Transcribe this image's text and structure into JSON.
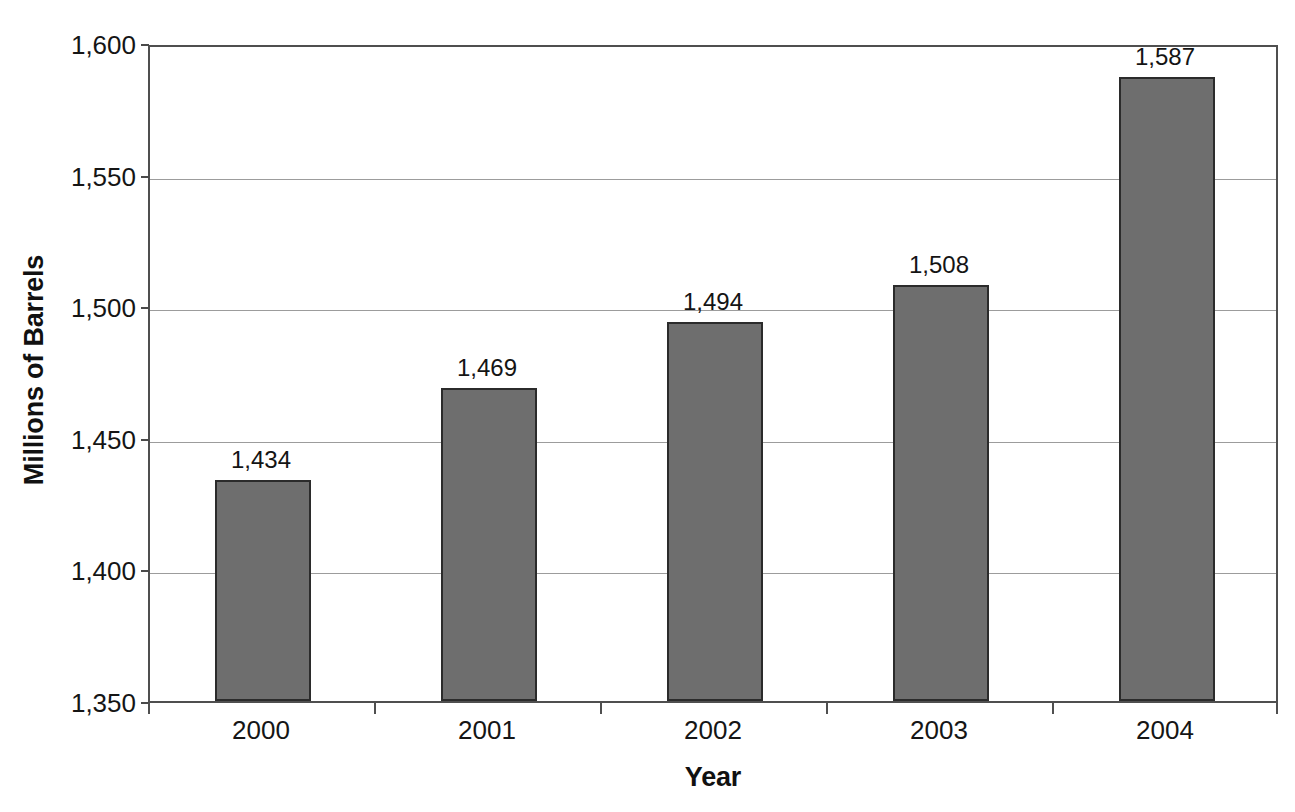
{
  "chart_data": {
    "type": "bar",
    "title": "",
    "subtitle": "",
    "xlabel": "Year",
    "ylabel": "Millions of Barrels",
    "categories": [
      "2000",
      "2001",
      "2002",
      "2003",
      "2004"
    ],
    "values": [
      1434,
      1469,
      1494,
      1508,
      1587
    ],
    "value_labels": [
      "1,434",
      "1,469",
      "1,494",
      "1,508",
      "1,587"
    ],
    "ylim": [
      1350,
      1600
    ],
    "ytick_values": [
      1350,
      1400,
      1450,
      1500,
      1550,
      1600
    ],
    "ytick_labels": [
      "1,350",
      "1,400",
      "1,450",
      "1,500",
      "1,550",
      "1,600"
    ],
    "grid": "horizontal",
    "legend": "none",
    "series": [
      {
        "name": "Millions of Barrels",
        "values": [
          1434,
          1469,
          1494,
          1508,
          1587
        ]
      }
    ],
    "colors": {
      "bar_fill": "#6e6e6e",
      "bar_border": "#2b2b2b",
      "gridline": "#9c9c9c",
      "axis": "#4f4f4f",
      "text": "#141414",
      "background": "#ffffff"
    }
  }
}
